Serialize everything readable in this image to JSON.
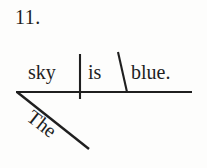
{
  "page": {
    "exercise_number": "11.",
    "background_color": "#fdfdfc",
    "ink_color": "#1f1f1f"
  },
  "diagram": {
    "type": "reed-kellogg-sentence-diagram",
    "sentence": "The sky is blue.",
    "baseline": {
      "label": "baseline",
      "x1": 16,
      "y1": 92,
      "x2": 192,
      "y2": 92
    },
    "subject_predicate_divider": {
      "label": "subject-predicate-divider",
      "x1": 80,
      "y1": 54,
      "x2": 80,
      "y2": 99
    },
    "predicate_adjective_slant": {
      "label": "predicate-adjective-slant",
      "x1": 118,
      "y1": 52,
      "x2": 127,
      "y2": 92
    },
    "modifier_diagonal": {
      "label": "modifier-diagonal",
      "x1": 17,
      "y1": 92,
      "x2": 89,
      "y2": 149
    },
    "words": {
      "subject": "sky",
      "verb": "is",
      "predicate_adjective": "blue.",
      "modifier": "The"
    },
    "roles": {
      "subject": "subject",
      "verb": "linking-verb",
      "predicate_adjective": "predicate-adjective",
      "modifier": "article-modifier"
    }
  }
}
